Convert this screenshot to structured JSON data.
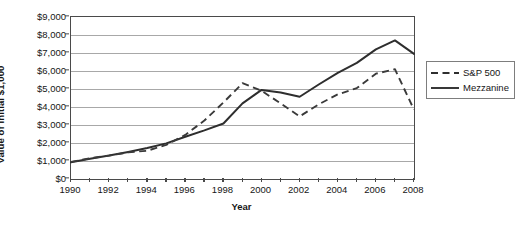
{
  "chart_data": {
    "type": "line",
    "title": "",
    "xlabel": "Year",
    "ylabel": "Value of Initial $1,000",
    "x": [
      1990,
      1991,
      1992,
      1993,
      1994,
      1995,
      1996,
      1997,
      1998,
      1999,
      2000,
      2001,
      2002,
      2003,
      2004,
      2005,
      2006,
      2007,
      2008
    ],
    "xlim": [
      1990,
      2008
    ],
    "ylim": [
      0,
      9000
    ],
    "y_ticks": [
      0,
      1000,
      2000,
      3000,
      4000,
      5000,
      6000,
      7000,
      8000,
      9000
    ],
    "y_tick_labels": [
      "$0",
      "$1,000",
      "$2,000",
      "$3,000",
      "$4,000",
      "$5,000",
      "$6,000",
      "$7,000",
      "$8,000",
      "$9,000"
    ],
    "x_tick_labels": [
      "1990",
      "1992",
      "1994",
      "1996",
      "1998",
      "2000",
      "2002",
      "2004",
      "2006",
      "2008"
    ],
    "x_tick_label_values": [
      1990,
      1992,
      1994,
      1996,
      1998,
      2000,
      2002,
      2004,
      2006,
      2008
    ],
    "grid": true,
    "grid_axis": "y",
    "legend_position": "right",
    "series": [
      {
        "name": "S&P 500",
        "style": "dashed",
        "color": "#3a3a3a",
        "values": [
          950,
          1150,
          1300,
          1480,
          1570,
          1900,
          2450,
          3250,
          4250,
          5320,
          4900,
          4200,
          3480,
          4150,
          4700,
          5050,
          5850,
          6100,
          3850
        ]
      },
      {
        "name": "Mezzanine",
        "style": "solid",
        "color": "#2e2e2e",
        "values": [
          930,
          1120,
          1300,
          1500,
          1720,
          1980,
          2350,
          2700,
          3080,
          4200,
          4950,
          4800,
          4570,
          5250,
          5900,
          6450,
          7200,
          7700,
          6950
        ]
      }
    ]
  },
  "legend": {
    "entries": [
      {
        "label": "S&P 500",
        "style": "dashed"
      },
      {
        "label": "Mezzanine",
        "style": "solid"
      }
    ]
  },
  "axis_titles": {
    "y": "Value of Initial $1,000",
    "x": "Year"
  }
}
